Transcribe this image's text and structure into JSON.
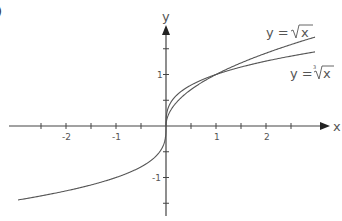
{
  "figure": {
    "corner_label": ")"
  },
  "chart_data": {
    "type": "line",
    "title": "",
    "xlabel": "x",
    "ylabel": "y",
    "xlim": [
      -3.1,
      3.3
    ],
    "ylim": [
      -1.8,
      2.0
    ],
    "x_ticks": [
      -2.5,
      -2,
      -1.5,
      -1,
      -0.5,
      0.5,
      1,
      1.5,
      2,
      2.5
    ],
    "x_tick_labels": [
      {
        "value": -2,
        "label": "-2"
      },
      {
        "value": -1,
        "label": "-1"
      },
      {
        "value": 1,
        "label": "1"
      },
      {
        "value": 2,
        "label": "2"
      }
    ],
    "y_ticks": [
      -1.5,
      -1,
      -0.5,
      0.5,
      1,
      1.5
    ],
    "y_tick_labels": [
      {
        "value": 1,
        "label": "1"
      },
      {
        "value": -1,
        "label": "-1"
      }
    ],
    "grid": false,
    "series": [
      {
        "name": "y = √x",
        "function": "sqrt",
        "domain": [
          0,
          2.98
        ],
        "x": [
          0,
          0.25,
          0.5,
          1,
          1.5,
          2,
          2.5,
          2.98
        ],
        "values": [
          0,
          0.5,
          0.707,
          1,
          1.225,
          1.414,
          1.581,
          1.726
        ]
      },
      {
        "name": "y = ∛x",
        "function": "cbrt",
        "domain": [
          -2.96,
          2.98
        ],
        "x": [
          -2.96,
          -2,
          -1,
          -0.5,
          0,
          0.5,
          1,
          2,
          2.98
        ],
        "values": [
          -1.436,
          -1.26,
          -1,
          -0.794,
          0,
          0.794,
          1,
          1.26,
          1.439
        ]
      }
    ],
    "annotations": [
      {
        "text_prefix": "y = ",
        "radical_index": "",
        "radicand": "x",
        "label": "y = √x"
      },
      {
        "text_prefix": "y = ",
        "radical_index": "3",
        "radicand": "x",
        "label": "y = ∛x"
      }
    ]
  }
}
